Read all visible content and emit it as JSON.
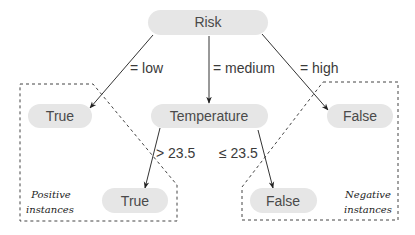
{
  "colors": {
    "node_fill": "#e6e6e6",
    "node_text": "#4a4a4a",
    "edge": "#333333",
    "group_border": "#444444"
  },
  "nodes": {
    "root": {
      "label": "Risk"
    },
    "low_leaf": {
      "label": "True"
    },
    "temperature": {
      "label": "Temperature"
    },
    "high_leaf": {
      "label": "False"
    },
    "gt_leaf": {
      "label": "True"
    },
    "le_leaf": {
      "label": "False"
    }
  },
  "edges": {
    "low": {
      "label": "= low"
    },
    "medium": {
      "label": "= medium"
    },
    "high": {
      "label": "= high"
    },
    "gt": {
      "label": "> 23.5"
    },
    "le": {
      "label": "≤ 23.5"
    }
  },
  "groups": {
    "positive": {
      "line1": "Positive",
      "line2": "instances"
    },
    "negative": {
      "line1": "Negative",
      "line2": "instances"
    }
  }
}
